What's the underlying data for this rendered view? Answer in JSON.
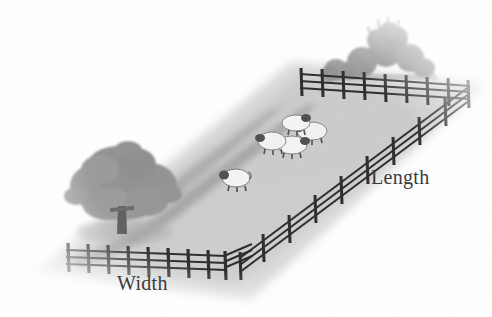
{
  "illustration": {
    "title": "Fenced rectangular sheep field with labelled dimensions",
    "background_color": "#ffffff"
  },
  "labels": {
    "length": "Length",
    "width": "Width"
  },
  "colors": {
    "field_light": "#d3d3d3",
    "field_mid": "#c2c2c2",
    "field_shadow": "#a8a8a8",
    "path_band": "#9d9d9d",
    "tree_canopy": "#949494",
    "tree_trunk": "#5e5e5e",
    "bush": "#8f8f8f",
    "fence": "#2e2e2e",
    "sheep_body": "#f4f4f4",
    "sheep_head": "#4a4a4a",
    "label_text": "#3a3a3a"
  },
  "scene_objects": {
    "field": {
      "name": "grass-field",
      "shape": "rectangle-in-perspective",
      "count": 1
    },
    "fences": [
      {
        "name": "fence-top",
        "posts": 9,
        "rails": 3,
        "orientation": "horizontal-back"
      },
      {
        "name": "fence-right",
        "posts": 9,
        "rails": 3,
        "orientation": "diagonal-descending"
      },
      {
        "name": "fence-bottom-left",
        "posts": 9,
        "rails": 3,
        "orientation": "horizontal-front"
      },
      {
        "name": "fence-bottom-right",
        "posts": 6,
        "rails": 3,
        "orientation": "diagonal-ascending"
      }
    ],
    "tree": {
      "name": "tree",
      "count": 1
    },
    "bushes": {
      "name": "bush-cluster",
      "count": 6
    },
    "sheep": {
      "lone": 1,
      "flock": 4,
      "total": 5
    }
  }
}
